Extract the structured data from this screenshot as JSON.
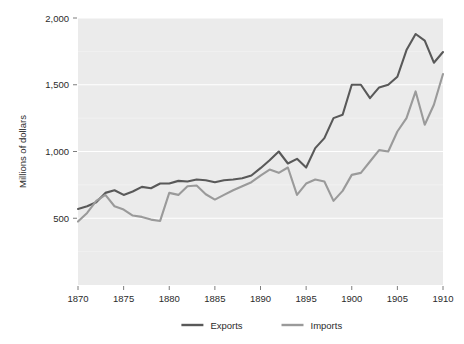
{
  "chart_data": {
    "type": "line",
    "title": "",
    "xlabel": "",
    "ylabel": "Millions of dollars",
    "xlim": [
      1870,
      1910
    ],
    "ylim": [
      0,
      2000
    ],
    "xticks": [
      "1870",
      "1875",
      "1880",
      "1885",
      "1890",
      "1895",
      "1900",
      "1905",
      "1910"
    ],
    "xtick_values": [
      1870,
      1875,
      1880,
      1885,
      1890,
      1895,
      1900,
      1905,
      1910
    ],
    "yticks": [
      "500",
      "1,000",
      "1,500",
      "2,000"
    ],
    "ytick_values": [
      500,
      1000,
      1500,
      2000
    ],
    "grid": "horizontal-major-only",
    "legend_position": "bottom-center",
    "plot_background": "#ebebeb",
    "gridline_color": "#ffffff",
    "x": [
      1870,
      1871,
      1872,
      1873,
      1874,
      1875,
      1876,
      1877,
      1878,
      1879,
      1880,
      1881,
      1882,
      1883,
      1884,
      1885,
      1886,
      1887,
      1888,
      1889,
      1890,
      1891,
      1892,
      1893,
      1894,
      1895,
      1896,
      1897,
      1898,
      1899,
      1900,
      1901,
      1902,
      1903,
      1904,
      1905,
      1906,
      1907,
      1908,
      1909,
      1910
    ],
    "series": [
      {
        "name": "Exports",
        "color": "#595959",
        "values": [
          570,
          590,
          620,
          690,
          710,
          675,
          700,
          735,
          725,
          760,
          760,
          780,
          775,
          790,
          785,
          770,
          785,
          790,
          800,
          820,
          875,
          935,
          1000,
          910,
          945,
          880,
          1025,
          1100,
          1250,
          1275,
          1500,
          1500,
          1400,
          1480,
          1500,
          1560,
          1760,
          1880,
          1830,
          1665,
          1745
        ]
      },
      {
        "name": "Imports",
        "color": "#9a9a9a",
        "values": [
          475,
          540,
          630,
          675,
          590,
          565,
          520,
          510,
          490,
          480,
          690,
          675,
          740,
          745,
          680,
          640,
          675,
          710,
          740,
          770,
          820,
          865,
          840,
          880,
          675,
          760,
          790,
          775,
          630,
          705,
          825,
          840,
          925,
          1010,
          1000,
          1150,
          1250,
          1450,
          1200,
          1350,
          1580
        ]
      }
    ]
  },
  "legend": {
    "items": [
      {
        "label": "Exports",
        "color": "#595959"
      },
      {
        "label": "Imports",
        "color": "#9a9a9a"
      }
    ]
  }
}
